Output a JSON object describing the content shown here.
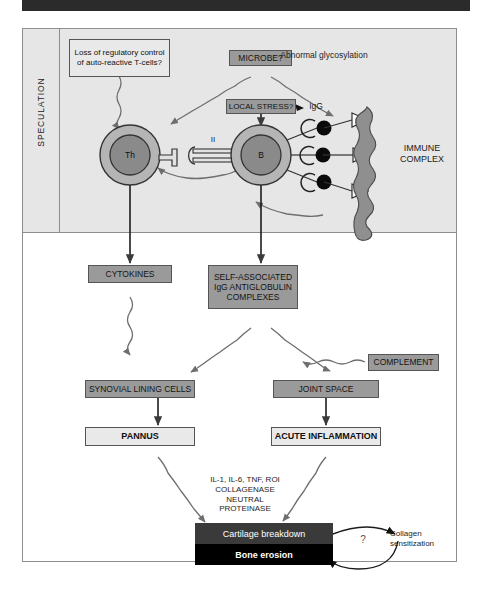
{
  "figure": {
    "top_bar": "",
    "speculation_label": "SPECULATION"
  },
  "nodes": {
    "loss_regulatory": "Loss of regulatory control of auto-reactive T-cells?",
    "microbe": "MICROBE?",
    "local_stress": "LOCAL STRESS?",
    "abnormal_glycosylation": "Abnormal glycosylation",
    "igg": "IgG",
    "immune_complex": "IMMUNE COMPLEX",
    "th_cell": "Th",
    "b_cell": "B",
    "mhc_class": "II",
    "cytokines": "CYTOKINES",
    "self_associated": "SELF-ASSOCIATED IgG ANTIGLOBULIN COMPLEXES",
    "complement": "COMPLEMENT",
    "synovial": "SYNOVIAL LINING CELLS",
    "joint_space": "JOINT SPACE",
    "pannus": "PANNUS",
    "acute_inflammation": "ACUTE INFLAMMATION",
    "mediators": "IL-1, IL-6, TNF, ROI COLLAGENASE NEUTRAL PROTEINASE",
    "mediators_lines": [
      "IL-1, IL-6, TNF, ROI",
      "COLLAGENASE",
      "NEUTRAL",
      "PROTEINASE"
    ],
    "cartilage_breakdown": "Cartilage breakdown",
    "bone_erosion": "Bone erosion",
    "collagen_sensitization": "Collagen sensitization",
    "question_mark": "?"
  },
  "colors": {
    "top_bar": "#2b2b2b",
    "panel_bg": "#e6e6e6",
    "gray_box": "#9a9a9a",
    "light_box": "#e9e9e9",
    "cartilage_box": "#3a3a3a",
    "bone_box": "#000000",
    "cell_ring": "#b5b5b5",
    "cell_core": "#8a8a8a",
    "blob": "#8f8f8f",
    "frame_border": "#8e8e8e"
  }
}
